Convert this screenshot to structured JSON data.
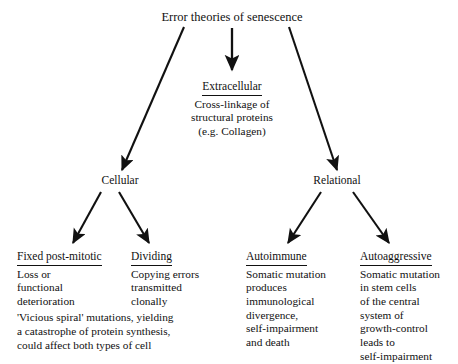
{
  "diagram": {
    "type": "tree-flowchart",
    "title": "Error theories of senescence",
    "background_color": "#ffffff",
    "text_color": "#111111",
    "branches": {
      "extracellular": {
        "heading": "Extracellular",
        "lines": [
          "Cross-linkage of",
          "structural proteins",
          "(e.g. Collagen)"
        ]
      },
      "cellular": {
        "label": "Cellular",
        "children": {
          "fixed_post_mitotic": {
            "heading": "Fixed post-mitotic",
            "lines": [
              "Loss or",
              "functional",
              "deterioration"
            ]
          },
          "dividing": {
            "heading": "Dividing",
            "lines": [
              "Copying errors",
              "transmitted",
              "clonally"
            ]
          }
        },
        "note": [
          "'Vicious spiral' mutations, yielding",
          "a catastrophe of protein synthesis,",
          "could affect both types of cell"
        ]
      },
      "relational": {
        "label": "Relational",
        "children": {
          "autoimmune": {
            "heading": "Autoimmune",
            "lines": [
              "Somatic mutation",
              "produces",
              "immunological",
              "divergence,",
              "self-impairment",
              "and death"
            ]
          },
          "autoaggressive": {
            "heading": "Autoaggressive",
            "lines": [
              "Somatic mutation",
              "in stem cells",
              "of the central",
              "system of",
              "growth-control",
              "leads to",
              "self-impairment",
              "and death"
            ]
          }
        }
      }
    }
  }
}
